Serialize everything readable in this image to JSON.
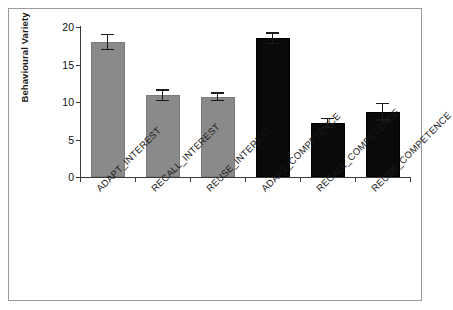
{
  "chart_data": {
    "type": "bar",
    "title": "",
    "subtitle": "",
    "xlabel": "",
    "ylabel": "Behavioural Variety",
    "ylim": [
      0,
      20
    ],
    "yticks": [
      0,
      5,
      10,
      15,
      20
    ],
    "ytick_labels": [
      "0",
      "5",
      "10",
      "15",
      "20"
    ],
    "grid": false,
    "legend": null,
    "categories": [
      "ADAPT_INTEREST",
      "RECALL_INTEREST",
      "REUSE_INTEREST",
      "ADAPT_COMPETENCE",
      "RECALL_COMPETENCE",
      "REUSE_COMPETENCE"
    ],
    "values": [
      18.0,
      10.9,
      10.7,
      18.5,
      7.2,
      8.7
    ],
    "errors": [
      1.1,
      0.8,
      0.6,
      0.8,
      0.7,
      1.2
    ],
    "bar_colors": [
      "#8a8a8a",
      "#8a8a8a",
      "#8a8a8a",
      "#0a0a0a",
      "#0a0a0a",
      "#0a0a0a"
    ],
    "series": [
      {
        "name": "Behavioural Variety",
        "values": [
          18.0,
          10.9,
          10.7,
          18.5,
          7.2,
          8.7
        ],
        "errors": [
          1.1,
          0.8,
          0.6,
          0.8,
          0.7,
          1.2
        ]
      }
    ],
    "annotations": []
  },
  "axis": {
    "y_title": "Behavioural Variety"
  },
  "colors": {
    "bar_gray": "#8a8a8a",
    "bar_black": "#0a0a0a",
    "axis": "#3a3a3a",
    "frame": "#9a9a9a",
    "background": "#ffffff",
    "text": "#1a1a1a"
  }
}
